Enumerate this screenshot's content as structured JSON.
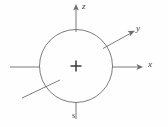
{
  "figure": {
    "background_color": "#fefefe",
    "stroke_color": "#6e6e6e",
    "label_color": "#3a3a3a",
    "center_marker": "+",
    "circle": {
      "cx": 76,
      "cy": 66,
      "r": 36.5
    },
    "axes": [
      {
        "name": "z-axis",
        "label": "z",
        "direction": "up",
        "arrow": true,
        "from": [
          76,
          29
        ],
        "to": [
          76,
          6
        ]
      },
      {
        "name": "y-axis",
        "label": "y",
        "direction": "upper-right-diagonal",
        "arrow": true,
        "from": [
          103,
          48
        ],
        "to": [
          134,
          31
        ]
      },
      {
        "name": "x-axis",
        "label": "x",
        "direction": "right",
        "arrow": true,
        "from": [
          112,
          67
        ],
        "to": [
          143,
          67
        ]
      },
      {
        "name": "negative-x-axis",
        "label": "",
        "direction": "left",
        "arrow": false,
        "from": [
          40,
          67
        ],
        "to": [
          10,
          67
        ]
      },
      {
        "name": "negative-y-axis",
        "label": "",
        "direction": "lower-left-diagonal",
        "arrow": false,
        "from": [
          59,
          81
        ],
        "to": [
          22,
          98
        ]
      },
      {
        "name": "negative-z-axis",
        "label": "s",
        "direction": "down",
        "arrow": false,
        "from": [
          76,
          102
        ],
        "to": [
          76,
          119
        ]
      }
    ],
    "labels": {
      "z": "z",
      "y": "y",
      "x": "x",
      "s": "s"
    }
  }
}
